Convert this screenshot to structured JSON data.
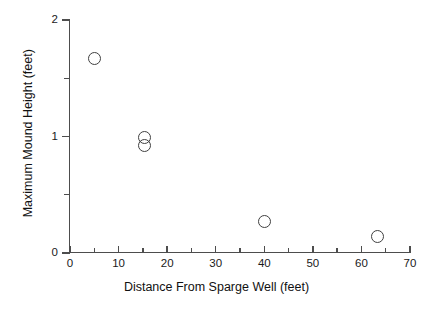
{
  "chart_data": {
    "type": "scatter",
    "title": "",
    "xlabel": "Distance From Sparge Well (feet)",
    "ylabel": "Maximum Mound Height (feet)",
    "xlim": [
      0,
      70
    ],
    "ylim": [
      0,
      2
    ],
    "grid": false,
    "legend": null,
    "marker": "open-circle",
    "marker_color": "#404040",
    "x_ticks": [
      0,
      10,
      20,
      30,
      40,
      50,
      60,
      70
    ],
    "x_tick_labels": [
      "0",
      "10",
      "20",
      "30",
      "40",
      "50",
      "60",
      "70"
    ],
    "x_minor_ticks": [
      5,
      15,
      25,
      35,
      45,
      55,
      65
    ],
    "y_ticks": [
      0,
      1,
      2
    ],
    "y_tick_labels": [
      "0",
      "1",
      "2"
    ],
    "y_minor_ticks": [
      0.5,
      1.5
    ],
    "points": [
      {
        "x": 5.0,
        "y": 1.67
      },
      {
        "x": 15.4,
        "y": 0.99
      },
      {
        "x": 15.4,
        "y": 0.92
      },
      {
        "x": 40.0,
        "y": 0.27
      },
      {
        "x": 63.4,
        "y": 0.14
      }
    ]
  },
  "axes": {
    "x_title": "Distance From Sparge Well (feet)",
    "y_title": "Maximum Mound Height (feet)"
  },
  "colors": {
    "axis": "#4d4d4d",
    "text": "#1a1a1a",
    "marker": "#404040",
    "background": "#ffffff"
  }
}
